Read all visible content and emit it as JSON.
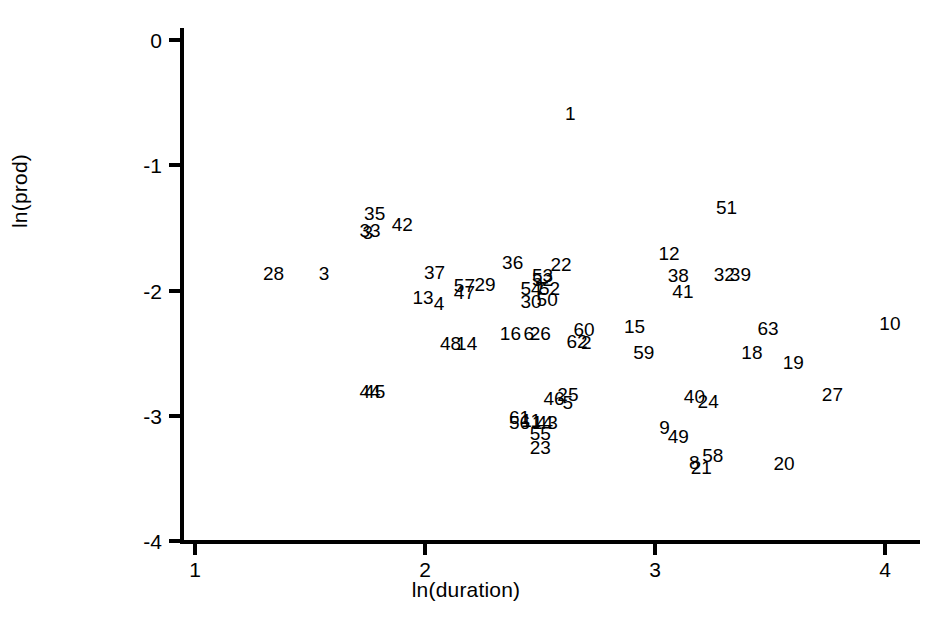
{
  "chart_data": {
    "type": "scatter",
    "title": "",
    "subtitle": "",
    "xlabel": "ln(duration)",
    "ylabel": "ln(prod)",
    "xlim": [
      0.935,
      4.13
    ],
    "ylim": [
      -4.09,
      0.096
    ],
    "xticks": [
      1,
      2,
      3,
      4
    ],
    "xtick_labels": [
      "1",
      "2",
      "3",
      "4"
    ],
    "yticks": [
      0,
      -1,
      -2,
      -3,
      -4
    ],
    "ytick_labels": [
      "0",
      "-1",
      "-2",
      "-3",
      "-4"
    ],
    "grid": false,
    "legend": null,
    "marker_style": "text-label",
    "note": "Each observation is drawn as its numeric case label instead of a plotting symbol; several labels overlap in dense regions.",
    "points": [
      {
        "label": "1",
        "x": 2.64,
        "y": -0.58
      },
      {
        "label": "51",
        "x": 3.32,
        "y": -1.33
      },
      {
        "label": "35",
        "x": 1.79,
        "y": -1.38
      },
      {
        "label": "42",
        "x": 1.91,
        "y": -1.47
      },
      {
        "label": "33",
        "x": 1.77,
        "y": -1.52
      },
      {
        "label": "3",
        "x": 1.76,
        "y": -1.53
      },
      {
        "label": "12",
        "x": 3.07,
        "y": -1.7
      },
      {
        "label": "36",
        "x": 2.39,
        "y": -1.77
      },
      {
        "label": "22",
        "x": 2.6,
        "y": -1.79
      },
      {
        "label": "28",
        "x": 1.35,
        "y": -1.86
      },
      {
        "label": "3b",
        "x": 1.57,
        "y": -1.86
      },
      {
        "label": "37",
        "x": 2.05,
        "y": -1.85
      },
      {
        "label": "38",
        "x": 3.11,
        "y": -1.88
      },
      {
        "label": "32",
        "x": 3.31,
        "y": -1.87
      },
      {
        "label": "39",
        "x": 3.38,
        "y": -1.87
      },
      {
        "label": "53",
        "x": 2.52,
        "y": -1.88
      },
      {
        "label": "52b",
        "x": 2.52,
        "y": -1.91
      },
      {
        "label": "57",
        "x": 2.18,
        "y": -1.96
      },
      {
        "label": "29",
        "x": 2.27,
        "y": -1.95
      },
      {
        "label": "54",
        "x": 2.47,
        "y": -1.98
      },
      {
        "label": "7",
        "x": 2.51,
        "y": -1.98
      },
      {
        "label": "52",
        "x": 2.55,
        "y": -1.98
      },
      {
        "label": "47",
        "x": 2.18,
        "y": -2.01
      },
      {
        "label": "41",
        "x": 3.13,
        "y": -2.0
      },
      {
        "label": "13",
        "x": 2.0,
        "y": -2.05
      },
      {
        "label": "30",
        "x": 2.47,
        "y": -2.08
      },
      {
        "label": "50",
        "x": 2.54,
        "y": -2.07
      },
      {
        "label": "4",
        "x": 2.07,
        "y": -2.1
      },
      {
        "label": "10",
        "x": 4.03,
        "y": -2.26
      },
      {
        "label": "15",
        "x": 2.92,
        "y": -2.28
      },
      {
        "label": "16",
        "x": 2.38,
        "y": -2.34
      },
      {
        "label": "6",
        "x": 2.46,
        "y": -2.34
      },
      {
        "label": "26",
        "x": 2.51,
        "y": -2.34
      },
      {
        "label": "60",
        "x": 2.7,
        "y": -2.31
      },
      {
        "label": "63",
        "x": 3.5,
        "y": -2.3
      },
      {
        "label": "62",
        "x": 2.67,
        "y": -2.4
      },
      {
        "label": "2",
        "x": 2.71,
        "y": -2.41
      },
      {
        "label": "48",
        "x": 2.12,
        "y": -2.42
      },
      {
        "label": "14",
        "x": 2.19,
        "y": -2.42
      },
      {
        "label": "59",
        "x": 2.96,
        "y": -2.49
      },
      {
        "label": "18",
        "x": 3.43,
        "y": -2.49
      },
      {
        "label": "19",
        "x": 3.61,
        "y": -2.57
      },
      {
        "label": "44",
        "x": 1.77,
        "y": -2.8
      },
      {
        "label": "45",
        "x": 1.79,
        "y": -2.8
      },
      {
        "label": "27",
        "x": 3.78,
        "y": -2.83
      },
      {
        "label": "25",
        "x": 2.63,
        "y": -2.83
      },
      {
        "label": "46",
        "x": 2.57,
        "y": -2.86
      },
      {
        "label": "5",
        "x": 2.63,
        "y": -2.89
      },
      {
        "label": "40",
        "x": 3.18,
        "y": -2.84
      },
      {
        "label": "24",
        "x": 3.24,
        "y": -2.88
      },
      {
        "label": "61",
        "x": 2.42,
        "y": -3.01
      },
      {
        "label": "11",
        "x": 2.47,
        "y": -3.03
      },
      {
        "label": "43",
        "x": 2.54,
        "y": -3.05
      },
      {
        "label": "56",
        "x": 2.42,
        "y": -3.05
      },
      {
        "label": "14b",
        "x": 2.52,
        "y": -3.05
      },
      {
        "label": "9",
        "x": 3.05,
        "y": -3.09
      },
      {
        "label": "55",
        "x": 2.51,
        "y": -3.14
      },
      {
        "label": "49",
        "x": 3.11,
        "y": -3.16
      },
      {
        "label": "23",
        "x": 2.51,
        "y": -3.25
      },
      {
        "label": "58",
        "x": 3.26,
        "y": -3.31
      },
      {
        "label": "8",
        "x": 3.18,
        "y": -3.37
      },
      {
        "label": "20",
        "x": 3.57,
        "y": -3.38
      },
      {
        "label": "21",
        "x": 3.21,
        "y": -3.41
      }
    ]
  },
  "axes": {
    "x_title": "ln(duration)",
    "y_title": "ln(prod)",
    "x_tick_labels": [
      "1",
      "2",
      "3",
      "4"
    ],
    "y_tick_labels": [
      "0",
      "-1",
      "-2",
      "-3",
      "-4"
    ]
  },
  "colors": {
    "axis": "#000000",
    "text": "#000000",
    "background": "#ffffff"
  }
}
